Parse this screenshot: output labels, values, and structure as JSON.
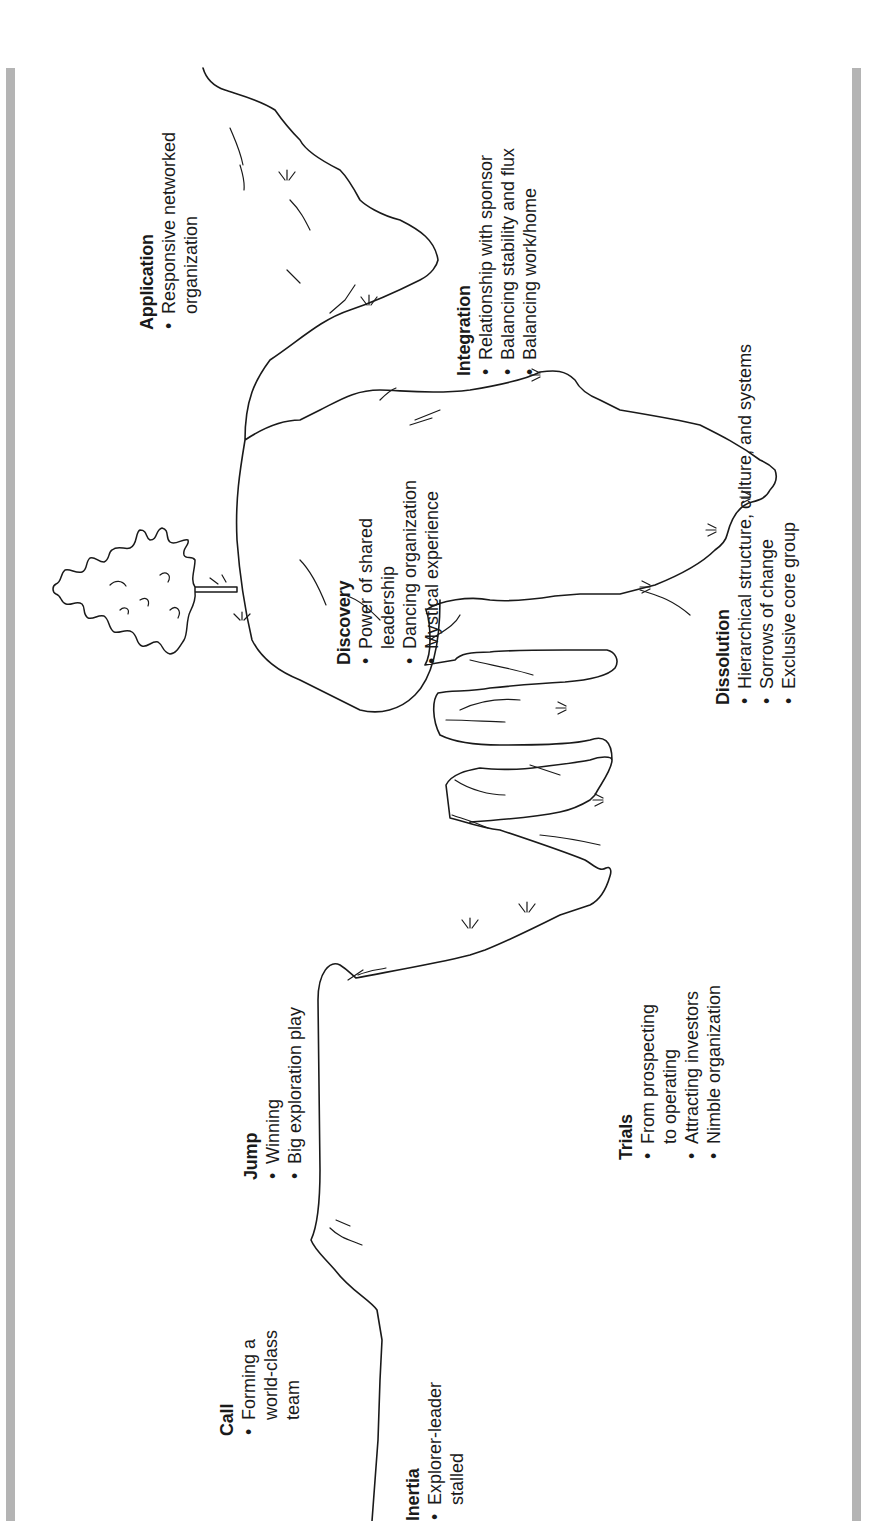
{
  "diagram": {
    "orientation": "rotated 90 degrees counter-clockwise",
    "colors": {
      "line": "#1a1a1a",
      "frame_bar": "#b4b4b4",
      "background": "#ffffff"
    },
    "stages": [
      {
        "title": "Inertia",
        "bullets": [
          "Explorer-leader\nstalled"
        ]
      },
      {
        "title": "Call",
        "bullets": [
          "Forming a\nworld-class\nteam"
        ]
      },
      {
        "title": "Jump",
        "bullets": [
          "Winning",
          "Big exploration play"
        ]
      },
      {
        "title": "Trials",
        "bullets": [
          "From prospecting\nto operating",
          "Attracting investors",
          "Nimble organization"
        ]
      },
      {
        "title": "Dissolution",
        "bullets": [
          "Hierarchical structure, culture, and systems",
          "Sorrows of change",
          "Exclusive core group"
        ]
      },
      {
        "title": "Discovery",
        "bullets": [
          "Power of shared\nleadership",
          "Dancing organization",
          "Mystical experience"
        ]
      },
      {
        "title": "Integration",
        "bullets": [
          "Relationship with sponsor",
          "Balancing stability and flux",
          "Balancing work/home"
        ]
      },
      {
        "title": "Application",
        "bullets": [
          "Responsive networked\norganization"
        ]
      }
    ],
    "illustrations": [
      "mountain-path-line",
      "tree-icon"
    ]
  }
}
